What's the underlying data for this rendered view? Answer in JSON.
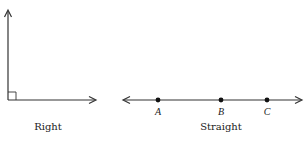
{
  "diagrams": [
    {
      "id": "right",
      "caption": "Right",
      "type": "right-angle",
      "vertex": [
        8,
        100
      ],
      "ray_up_tip": [
        8,
        10
      ],
      "ray_right_tip": [
        96,
        100
      ],
      "right_angle_marker_size": 8
    },
    {
      "id": "straight",
      "caption": "Straight",
      "type": "straight-line",
      "left_tip": [
        123,
        100
      ],
      "right_tip": [
        302,
        100
      ],
      "points": [
        {
          "label": "A",
          "x": 158
        },
        {
          "label": "B",
          "x": 221
        },
        {
          "label": "C",
          "x": 267
        }
      ]
    }
  ],
  "colors": {
    "stroke": "#333333",
    "text": "#222222"
  }
}
